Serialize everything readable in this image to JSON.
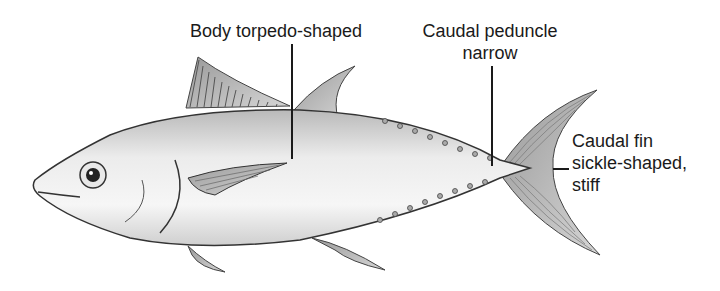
{
  "diagram": {
    "labels": [
      {
        "id": "body",
        "lines": [
          "Body torpedo-shaped"
        ]
      },
      {
        "id": "peduncle",
        "lines": [
          "Caudal peduncle",
          "narrow"
        ]
      },
      {
        "id": "caudal_fin",
        "lines": [
          "Caudal fin",
          "sickle-shaped,",
          "stiff"
        ]
      }
    ]
  },
  "colors": {
    "background": "#ffffff",
    "text": "#1a1a1a",
    "body_light": "#f2f2f2",
    "body_mid": "#c8c8c8",
    "outline": "#333333",
    "fin": "#8a8a8a"
  }
}
